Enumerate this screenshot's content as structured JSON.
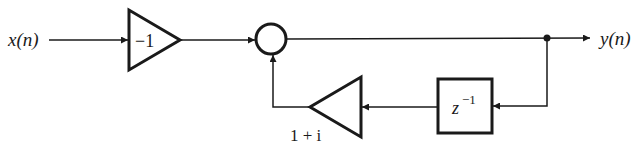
{
  "diagram": {
    "type": "signal-flow block diagram",
    "input": {
      "label": "x(n)"
    },
    "output": {
      "label": "y(n)"
    },
    "gain_forward": {
      "label": "−1",
      "value": -1
    },
    "adder": {
      "shape": "circle"
    },
    "delay": {
      "base": "z",
      "exponent": "−1"
    },
    "gain_feedback": {
      "label": "1 + i",
      "value": "1 + i"
    },
    "colors": {
      "stroke": "#1a1a1a",
      "background": "#ffffff"
    }
  }
}
